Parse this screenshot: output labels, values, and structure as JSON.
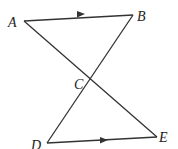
{
  "diagram": {
    "points": {
      "A": {
        "label": "A",
        "x": 24,
        "y": 21
      },
      "B": {
        "label": "B",
        "x": 133,
        "y": 15
      },
      "C": {
        "label": "C",
        "x": 91,
        "y": 80
      },
      "D": {
        "label": "D",
        "x": 47,
        "y": 143
      },
      "E": {
        "label": "E",
        "x": 157,
        "y": 137
      }
    },
    "segments": [
      "AB",
      "AE",
      "BD",
      "DE"
    ],
    "parallel_marks": [
      "AB",
      "DE"
    ]
  }
}
